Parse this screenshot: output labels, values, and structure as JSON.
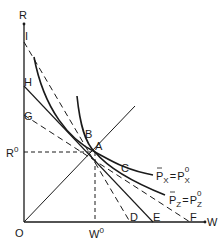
{
  "diagram": {
    "axes": {
      "y_label": "R",
      "x_label": "W",
      "origin_label": "O"
    },
    "equilibrium": {
      "point_label": "A",
      "r_label": "R",
      "r_sup": "0",
      "w_label": "W",
      "w_sup": "0"
    },
    "points": {
      "I": "I",
      "H": "H",
      "G": "G",
      "B": "B",
      "C": "C",
      "D": "D",
      "E": "E",
      "F": "F"
    },
    "curves": {
      "px": {
        "lhs": "P",
        "lhs_sub": "X",
        "eq": "=",
        "rhs": "P",
        "rhs_sub": "X",
        "rhs_sup": "0"
      },
      "pz": {
        "lhs": "P",
        "lhs_sub": "Z",
        "eq": "=",
        "rhs": "P",
        "rhs_sub": "Z",
        "rhs_sup": "0"
      }
    },
    "colors": {
      "line": "#1a1a1a",
      "background": "#ffffff"
    }
  }
}
